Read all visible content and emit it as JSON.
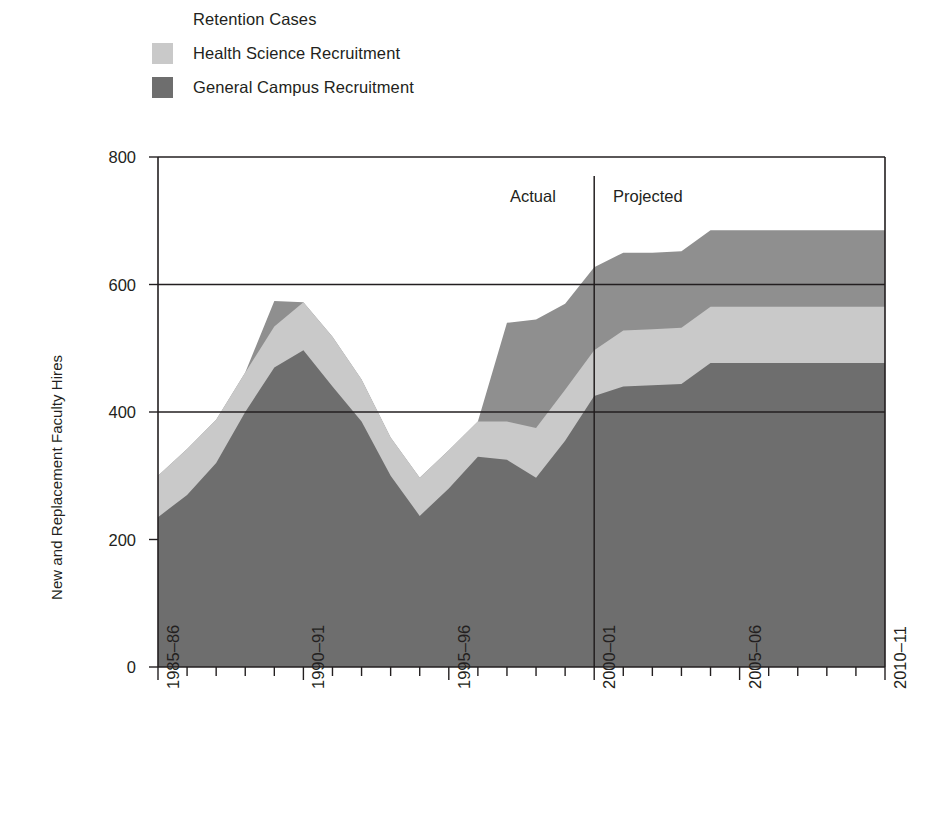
{
  "legend": {
    "items": [
      {
        "label": "Retention Cases",
        "color": "#8f8f8f",
        "key": "retention"
      },
      {
        "label": "Health Science Recruitment",
        "color": "#c9c9c9",
        "key": "health_science"
      },
      {
        "label": "General Campus Recruitment",
        "color": "#6e6e6e",
        "key": "general_campus"
      }
    ]
  },
  "axes": {
    "ylabel": "New and Replacement Faculty Hires",
    "yticks": [
      "800",
      "600",
      "400",
      "200",
      "0"
    ],
    "xlabels": [
      "1985–86",
      "1990–91",
      "1995–96",
      "2000–01",
      "2005–06",
      "2010–11"
    ]
  },
  "annotations": {
    "actual": "Actual",
    "projected": "Projected",
    "divider_at": "2000–01"
  },
  "chart_data": {
    "type": "area",
    "title": "",
    "subtitle": "",
    "xlabel": "",
    "ylabel": "New and Replacement Faculty Hires",
    "ylim": [
      0,
      800
    ],
    "yticks": [
      0,
      200,
      400,
      600,
      800
    ],
    "gridlines": [
      400,
      600,
      800
    ],
    "grid": true,
    "legend_position": "above-left",
    "stacked": true,
    "stack_order": [
      "General Campus Recruitment",
      "Health Science Recruitment",
      "Retention Cases"
    ],
    "x": [
      "1985–86",
      "1986–87",
      "1987–88",
      "1988–89",
      "1989–90",
      "1990–91",
      "1991–92",
      "1992–93",
      "1993–94",
      "1994–95",
      "1995–96",
      "1996–97",
      "1997–98",
      "1998–99",
      "1999–00",
      "2000–01",
      "2001–02",
      "2002–03",
      "2003–04",
      "2004–05",
      "2005–06",
      "2006–07",
      "2007–08",
      "2008–09",
      "2009–10",
      "2010–11"
    ],
    "xtick_labels_every": 5,
    "series": [
      {
        "name": "General Campus Recruitment",
        "color": "#6e6e6e",
        "values": [
          235,
          270,
          320,
          400,
          470,
          497,
          440,
          385,
          300,
          237,
          280,
          330,
          325,
          297,
          355,
          425,
          440,
          442,
          444,
          477,
          477,
          477,
          477,
          477,
          477,
          477
        ]
      },
      {
        "name": "Health Science Recruitment",
        "color": "#c9c9c9",
        "values": [
          65,
          72,
          68,
          62,
          64,
          75,
          78,
          66,
          60,
          60,
          60,
          55,
          60,
          78,
          80,
          72,
          88,
          88,
          88,
          88,
          88,
          88,
          88,
          88,
          88,
          88
        ]
      },
      {
        "name": "Retention Cases",
        "color": "#8f8f8f",
        "values": [
          0,
          0,
          0,
          0,
          40,
          0,
          0,
          0,
          0,
          0,
          0,
          0,
          155,
          170,
          135,
          130,
          122,
          120,
          120,
          120,
          120,
          120,
          120,
          120,
          120,
          120
        ]
      }
    ],
    "totals": [
      300,
      342,
      388,
      462,
      574,
      572,
      518,
      451,
      360,
      297,
      340,
      385,
      540,
      545,
      570,
      600,
      650,
      650,
      652,
      685,
      685,
      685,
      685,
      685,
      685,
      685
    ],
    "annotations": [
      {
        "text": "Actual",
        "x": "1998–99",
        "y": 730
      },
      {
        "text": "Projected",
        "x": "2002–03",
        "y": 730
      },
      {
        "type": "vline",
        "x": "2000–01",
        "label": "Actual / Projected divider"
      }
    ]
  }
}
